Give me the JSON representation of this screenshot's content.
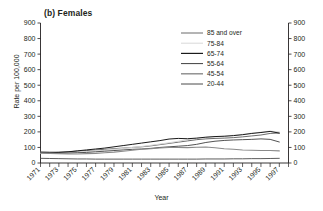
{
  "figure": {
    "panel_label": "(b) Females",
    "x_axis_title": "Year",
    "y_axis_title": "Rate per 100,000"
  },
  "chart_data": {
    "type": "line",
    "title": "(b) Females",
    "xlabel": "Year",
    "ylabel": "Rate per 100,000",
    "xlim": [
      1971,
      1998
    ],
    "ylim": [
      0,
      900
    ],
    "grid": false,
    "legend_position": "top-center-right",
    "y_ticks": [
      0,
      100,
      200,
      300,
      400,
      500,
      600,
      700,
      800,
      900
    ],
    "y_tick_labels": [
      "0",
      "100",
      "200",
      "300",
      "400",
      "500",
      "600",
      "700",
      "800",
      "900"
    ],
    "right_axis_ticks": [
      0,
      100,
      200,
      300,
      400,
      500,
      600,
      700,
      800,
      900
    ],
    "right_axis_tick_labels": [
      "0",
      "100",
      "200",
      "300",
      "400",
      "500",
      "600",
      "700",
      "800",
      "900"
    ],
    "x_ticks": [
      1971,
      1972,
      1973,
      1974,
      1975,
      1976,
      1977,
      1978,
      1979,
      1980,
      1981,
      1982,
      1983,
      1984,
      1985,
      1986,
      1987,
      1988,
      1989,
      1990,
      1991,
      1992,
      1993,
      1994,
      1995,
      1996,
      1997,
      1998
    ],
    "x_tick_labels_shown": [
      "1971",
      "1973",
      "1975",
      "1977",
      "1979",
      "1981",
      "1983",
      "1985",
      "1987",
      "1989",
      "1991",
      "1993",
      "1995",
      "1997"
    ],
    "x": [
      1971,
      1972,
      1973,
      1974,
      1975,
      1976,
      1977,
      1978,
      1979,
      1980,
      1981,
      1982,
      1983,
      1984,
      1985,
      1986,
      1987,
      1988,
      1989,
      1990,
      1991,
      1992,
      1993,
      1994,
      1995,
      1996,
      1997
    ],
    "series": [
      {
        "name": "85 and over",
        "color": "#5a5a5a",
        "width": 0.9,
        "values": [
          72,
          70,
          70,
          72,
          76,
          80,
          84,
          88,
          92,
          96,
          100,
          104,
          110,
          118,
          126,
          134,
          142,
          150,
          155,
          158,
          160,
          163,
          168,
          174,
          180,
          190,
          193
        ]
      },
      {
        "name": "75-84",
        "color": "#d8d8d8",
        "width": 1.0,
        "values": [
          62,
          62,
          64,
          66,
          70,
          74,
          78,
          82,
          88,
          94,
          100,
          106,
          114,
          122,
          130,
          140,
          150,
          158,
          164,
          168,
          172,
          178,
          184,
          192,
          198,
          205,
          200
        ]
      },
      {
        "name": "65-74",
        "color": "#1a1a1a",
        "width": 1.0,
        "values": [
          66,
          66,
          68,
          72,
          78,
          84,
          90,
          96,
          104,
          112,
          120,
          128,
          136,
          144,
          154,
          158,
          156,
          160,
          166,
          170,
          172,
          176,
          182,
          190,
          196,
          203,
          192
        ]
      },
      {
        "name": "55-64",
        "color": "#3f3f3f",
        "width": 0.9,
        "values": [
          68,
          66,
          64,
          64,
          66,
          68,
          72,
          76,
          80,
          84,
          88,
          90,
          94,
          100,
          104,
          108,
          112,
          120,
          132,
          140,
          145,
          148,
          150,
          152,
          155,
          152,
          135
        ]
      },
      {
        "name": "45-54",
        "color": "#8a8a8a",
        "width": 1.1,
        "values": [
          64,
          62,
          60,
          58,
          58,
          60,
          62,
          66,
          70,
          76,
          82,
          88,
          92,
          96,
          100,
          100,
          99,
          101,
          103,
          98,
          92,
          88,
          84,
          82,
          80,
          80,
          78
        ]
      },
      {
        "name": "20-44",
        "color": "#4a4a4a",
        "width": 0.9,
        "values": [
          30,
          29,
          28,
          27,
          26,
          26,
          25,
          25,
          25,
          25,
          25,
          25,
          25,
          25,
          25,
          25,
          25,
          25,
          26,
          26,
          26,
          27,
          27,
          28,
          28,
          29,
          30
        ]
      }
    ],
    "legend_entries": [
      {
        "label": "85 and over",
        "color": "#5a5a5a",
        "width": 0.9
      },
      {
        "label": "75-84",
        "color": "#d8d8d8",
        "width": 1.0
      },
      {
        "label": "65-74",
        "color": "#1a1a1a",
        "width": 1.2
      },
      {
        "label": "55-64",
        "color": "#3f3f3f",
        "width": 1.0
      },
      {
        "label": "45-54",
        "color": "#8a8a8a",
        "width": 1.4
      },
      {
        "label": "20-44",
        "color": "#4a4a4a",
        "width": 1.0
      }
    ]
  }
}
